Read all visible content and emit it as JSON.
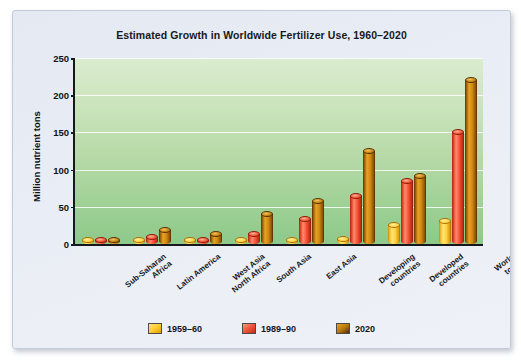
{
  "chart_data": {
    "type": "bar",
    "title": "Estimated Growth in Worldwide Fertilizer Use, 1960–2020",
    "xlabel": "",
    "ylabel": "Million nutrient tons",
    "ylim": [
      0,
      250
    ],
    "yticks": [
      0,
      50,
      100,
      150,
      200,
      250
    ],
    "grid": true,
    "legend_position": "bottom",
    "categories": [
      "Sub-Saharan\nAfrica",
      "Latin America",
      "West Asia\nNorth Africa",
      "South Asia",
      "East Asia",
      "Developing\ncountries",
      "Developed\ncountries",
      "World total"
    ],
    "series": [
      {
        "name": "1959–60",
        "color": "#ffcc2e",
        "values": [
          1,
          2,
          1,
          2,
          3,
          7,
          25,
          31
        ]
      },
      {
        "name": "1989–90",
        "color": "#f4513a",
        "values": [
          2,
          9,
          5,
          14,
          34,
          65,
          85,
          150
        ]
      },
      {
        "name": "2020",
        "color": "#b9790f",
        "values": [
          4,
          19,
          13,
          40,
          58,
          125,
          91,
          220
        ]
      }
    ]
  },
  "legend": {
    "items": [
      {
        "label": "1959–60"
      },
      {
        "label": "1989–90"
      },
      {
        "label": "2020"
      }
    ]
  }
}
